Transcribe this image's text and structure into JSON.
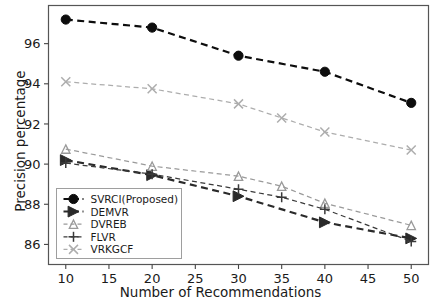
{
  "chart_data": {
    "type": "line",
    "title": "",
    "xlabel": "Number of Recommendations",
    "ylabel": "Precision percentage",
    "x": [
      10,
      20,
      30,
      40,
      50
    ],
    "xlim": [
      8,
      52
    ],
    "ylim": [
      85.0,
      97.9
    ],
    "xticks": [
      10,
      15,
      20,
      25,
      30,
      35,
      40,
      45,
      50
    ],
    "yticks": [
      86,
      88,
      90,
      92,
      94,
      96
    ],
    "grid": false,
    "legend_position": "lower left",
    "series": [
      {
        "name": "SVRCI(Proposed)",
        "marker": "circle",
        "linestyle": "dashed",
        "color": "#0d0d0d",
        "x": [
          10,
          20,
          30,
          40,
          50
        ],
        "values": [
          97.2,
          96.8,
          95.4,
          94.6,
          93.05
        ]
      },
      {
        "name": "DEMVR",
        "marker": "triangle-right",
        "linestyle": "dashed",
        "color": "#2a2a2a",
        "x": [
          10,
          20,
          30,
          40,
          50
        ],
        "values": [
          90.2,
          89.45,
          88.4,
          87.1,
          86.3
        ]
      },
      {
        "name": "DVREB",
        "marker": "triangle-up-thin",
        "linestyle": "dashed",
        "color": "#9a9a9a",
        "x": [
          10,
          20,
          30,
          35,
          40,
          50
        ],
        "values": [
          90.75,
          89.9,
          89.4,
          88.9,
          88.05,
          86.95
        ]
      },
      {
        "name": "FLVR",
        "marker": "plus",
        "linestyle": "dashed",
        "color": "#3a3a3a",
        "x": [
          10,
          20,
          30,
          35,
          40,
          50
        ],
        "values": [
          90.05,
          89.5,
          88.75,
          88.35,
          87.75,
          86.15
        ]
      },
      {
        "name": "VRKGCF",
        "marker": "x",
        "linestyle": "dashed",
        "color": "#adadad",
        "x": [
          10,
          20,
          30,
          35,
          40,
          50
        ],
        "values": [
          94.1,
          93.75,
          93.0,
          92.3,
          91.6,
          90.7
        ]
      }
    ]
  },
  "legend": {
    "items": [
      {
        "label": "SVRCI(Proposed)"
      },
      {
        "label": "DEMVR"
      },
      {
        "label": "DVREB"
      },
      {
        "label": "FLVR"
      },
      {
        "label": "VRKGCF"
      }
    ]
  }
}
